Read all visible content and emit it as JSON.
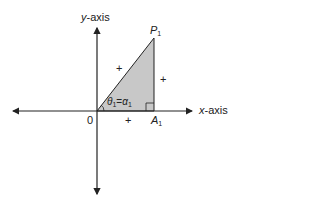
{
  "diagram": {
    "axes": {
      "x_label_var": "x",
      "x_label_rest": "-axis",
      "y_label_var": "y",
      "y_label_rest": "-axis",
      "origin_label": "0"
    },
    "points": {
      "P": {
        "name": "P",
        "sub": "1"
      },
      "A": {
        "name": "A",
        "sub": "1"
      }
    },
    "angle": {
      "theta": "θ",
      "theta_sub": "1",
      "eq": "=",
      "alpha": "α",
      "alpha_sub": "1"
    },
    "signs": {
      "hypotenuse": "+",
      "opposite": "+",
      "adjacent": "+"
    },
    "colors": {
      "fill": "#c8c8c8",
      "stroke": "#222222"
    }
  }
}
